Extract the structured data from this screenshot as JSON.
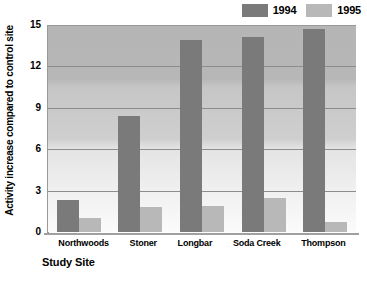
{
  "chart_data": {
    "type": "bar",
    "title": "",
    "xlabel": "Study Site",
    "ylabel": "Activity increase compared to control site",
    "categories": [
      "Northwoods",
      "Stoner",
      "Longbar",
      "Soda Creek",
      "Thompson"
    ],
    "series": [
      {
        "name": "1994",
        "color": "#7a7a7a",
        "values": [
          2.3,
          8.4,
          13.9,
          14.1,
          14.7
        ]
      },
      {
        "name": "1995",
        "color": "#b8b8b8",
        "values": [
          1.0,
          1.8,
          1.9,
          2.5,
          0.7
        ]
      }
    ],
    "ylim": [
      0,
      15
    ],
    "yticks": [
      0,
      3,
      6,
      9,
      12,
      15
    ],
    "grid": true,
    "legend_position": "top-right"
  },
  "legend": {
    "entries": [
      {
        "label": "1994",
        "color": "#7a7a7a"
      },
      {
        "label": "1995",
        "color": "#b8b8b8"
      }
    ]
  }
}
